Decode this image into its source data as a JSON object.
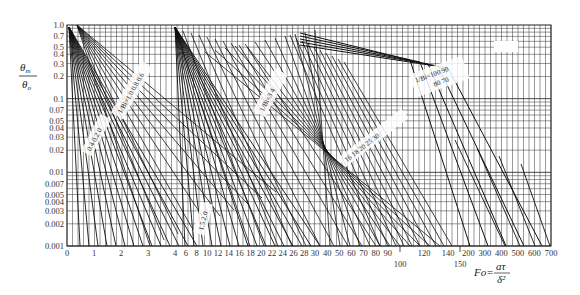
{
  "chart_data": {
    "type": "line",
    "title": "",
    "ylabel": "θm/θ0",
    "ylabel_num": "θ",
    "ylabel_num_sub": "m",
    "ylabel_den": "θ",
    "ylabel_den_sub": "o",
    "xlabel": "Fo=aτ/δ²",
    "xlabel_lhs": "Fo=",
    "xlabel_num": "aτ",
    "xlabel_den": "δ²",
    "yscale": "log",
    "ylim": [
      0.001,
      1.0
    ],
    "y_ticks": [
      "1.0",
      "0.7",
      "0.5",
      "0.4",
      "0.3",
      "0.2",
      "0.1",
      "0.07",
      "0.05",
      "0.04",
      "0.03",
      "0.02",
      "0.01",
      "0.007",
      "0.005",
      "0.004",
      "0.003",
      "0.002",
      "0.001"
    ],
    "y_tick_values": [
      1.0,
      0.7,
      0.5,
      0.4,
      0.3,
      0.2,
      0.1,
      0.07,
      0.05,
      0.04,
      0.03,
      0.02,
      0.01,
      0.007,
      0.005,
      0.004,
      0.003,
      0.002,
      0.001
    ],
    "xscale": "piecewise-linear",
    "x_segments": [
      {
        "from": 0,
        "to": 4,
        "px_from": 67,
        "px_to": 175
      },
      {
        "from": 4,
        "to": 30,
        "px_from": 175,
        "px_to": 315
      },
      {
        "from": 30,
        "to": 100,
        "px_from": 315,
        "px_to": 400
      },
      {
        "from": 100,
        "to": 150,
        "px_from": 400,
        "px_to": 460
      },
      {
        "from": 150,
        "to": 700,
        "px_from": 460,
        "px_to": 551
      }
    ],
    "x_ticks_row1": [
      "0",
      "1",
      "2",
      "3",
      "4",
      "6",
      "8",
      "10",
      "12",
      "14",
      "16",
      "18",
      "20",
      "22",
      "24",
      "26",
      "28",
      "30",
      "40",
      "50",
      "60",
      "70",
      "80",
      "90",
      "120",
      "140",
      "200",
      "300",
      "400",
      "500",
      "600",
      "700"
    ],
    "x_ticks_row2": [
      "100",
      "150"
    ],
    "grid": true,
    "legend": "none",
    "curve_label_groups": [
      {
        "text": "1/Bi = 0 … 1.0",
        "items": [
          "1/Bi=1.0",
          "0.8",
          "0.6",
          "0.5",
          "0.4",
          "0.3",
          "0.2",
          "0.1",
          "0"
        ]
      },
      {
        "text": "1/Bi = 1.0 … 3.5",
        "items": [
          "1/Bi=1.0",
          "1.2",
          "1.4",
          "1.6",
          "1.8",
          "2.0",
          "2.5",
          "3.0",
          "3.5"
        ]
      },
      {
        "text": "1/Bi = 3.5 … 14",
        "items": [
          "1/Bi=3",
          "4",
          "5",
          "6",
          "7",
          "8",
          "9",
          "10",
          "12",
          "14"
        ]
      },
      {
        "text": "1/Bi = 16 … 50",
        "items": [
          "16",
          "18",
          "20",
          "25",
          "30",
          "35",
          "40",
          "45",
          "50"
        ]
      },
      {
        "text": "1/Bi = 50 … 100",
        "items": [
          "1/Bi=100",
          "90",
          "80",
          "70",
          "60"
        ]
      }
    ],
    "series_summary": "Family of straight lines on semi-log axes: θm/θ0 decreases with Fo; each line corresponds to a value of 1/Bi; lines steepen as 1/Bi decreases."
  }
}
